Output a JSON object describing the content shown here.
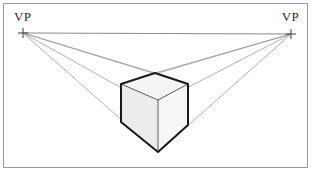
{
  "figure": {
    "background_color": "#ffffff",
    "frame": {
      "border_color": "#9a9a9a",
      "x": 3,
      "y": 3,
      "width": 305,
      "height": 165
    },
    "horizon": {
      "label": "horizon-line",
      "color": "#8a8a8a",
      "y": 33,
      "x_start": 23,
      "x_end": 291
    },
    "vanishing_points": [
      {
        "id": "left",
        "label": "VP",
        "x": 23,
        "y": 33,
        "marker": "plus-cross",
        "marker_color": "#555555",
        "marker_size": 9
      },
      {
        "id": "right",
        "label": "VP",
        "x": 291,
        "y": 34,
        "marker": "plus-cross",
        "marker_color": "#555555",
        "marker_size": 9
      }
    ],
    "cube": {
      "label": "cube",
      "top_face_color": "#f4f4f2",
      "left_face_color": "#ececea",
      "right_face_color": "#f6f6f4",
      "outline_color": "#1a1a1a",
      "inner_edge_color": "#4a4a4a",
      "outline_width": 2,
      "vertices": {
        "top_back": [
          155,
          73
        ],
        "top_left": [
          121,
          84
        ],
        "top_front": [
          158,
          100
        ],
        "top_right": [
          188,
          84
        ],
        "bottom_left": [
          121,
          122
        ],
        "bottom_front": [
          158,
          152
        ],
        "bottom_right": [
          188,
          125
        ]
      }
    },
    "construction_lines": {
      "color": "#8f8f8f",
      "width": 0.7,
      "from_left_vp": [
        [
          155,
          73
        ],
        [
          188,
          84
        ],
        [
          188,
          125
        ],
        [
          158,
          152
        ]
      ],
      "from_right_vp": [
        [
          155,
          73
        ],
        [
          121,
          84
        ],
        [
          121,
          122
        ],
        [
          158,
          152
        ]
      ]
    }
  }
}
